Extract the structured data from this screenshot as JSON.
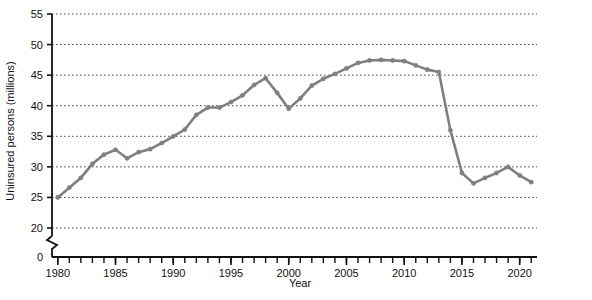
{
  "chart_data": {
    "type": "line",
    "title": "",
    "xlabel": "Year",
    "ylabel": "Uninsured persons (millions)",
    "xlim": [
      1979.5,
      2021.5
    ],
    "ylim": [
      20,
      55
    ],
    "y_axis_break": true,
    "y_break_labels": [
      "0",
      "20"
    ],
    "grid": true,
    "grid_axis": "y",
    "grid_style": "dotted",
    "legend": null,
    "line_color": "#7f7f7f",
    "marker": "circle",
    "x_tick_labels": [
      "1980",
      "1985",
      "1990",
      "1995",
      "2000",
      "2005",
      "2010",
      "2015",
      "2020"
    ],
    "x_tick_values": [
      1980,
      1985,
      1990,
      1995,
      2000,
      2005,
      2010,
      2015,
      2020
    ],
    "x_minor_ticks_every": 1,
    "y_tick_labels": [
      "0",
      "20",
      "25",
      "30",
      "35",
      "40",
      "45",
      "50",
      "55"
    ],
    "y_tick_values": [
      20,
      25,
      30,
      35,
      40,
      45,
      50,
      55
    ],
    "x": [
      1980,
      1981,
      1982,
      1983,
      1984,
      1985,
      1986,
      1987,
      1988,
      1989,
      1990,
      1991,
      1992,
      1993,
      1994,
      1995,
      1996,
      1997,
      1998,
      1999,
      2000,
      2001,
      2002,
      2003,
      2004,
      2005,
      2006,
      2007,
      2008,
      2009,
      2010,
      2011,
      2012,
      2013,
      2014,
      2015,
      2016,
      2017,
      2018,
      2019,
      2020,
      2021
    ],
    "values": [
      25.0,
      26.6,
      28.2,
      30.5,
      32.0,
      32.8,
      31.4,
      32.4,
      32.9,
      33.9,
      35.0,
      36.1,
      38.5,
      39.7,
      39.7,
      40.6,
      41.7,
      43.4,
      44.5,
      42.1,
      39.5,
      41.2,
      43.3,
      44.4,
      45.2,
      46.1,
      47.0,
      47.4,
      47.5,
      47.4,
      47.3,
      46.6,
      45.9,
      45.5,
      36.0,
      29.0,
      27.3,
      28.2,
      29.0,
      30.0,
      28.6,
      27.5
    ],
    "annotations": []
  }
}
